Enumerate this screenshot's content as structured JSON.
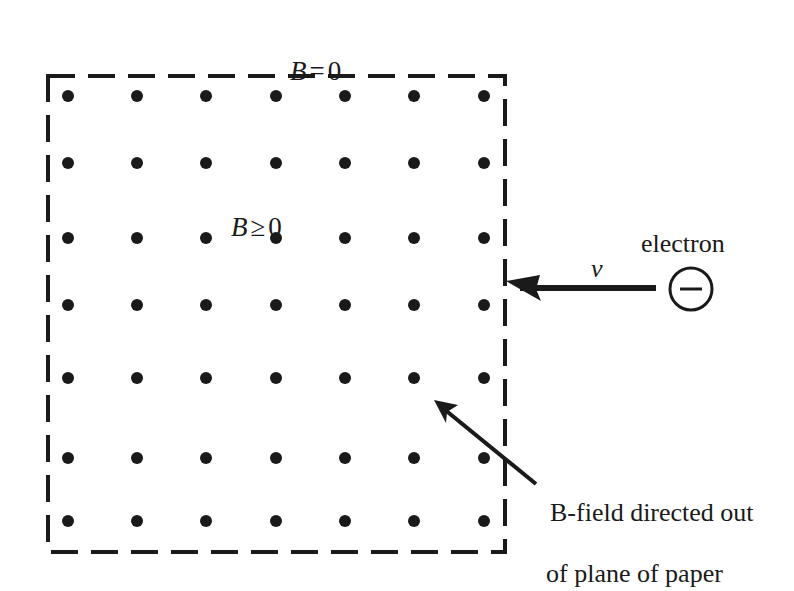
{
  "figure": {
    "background_color": "#ffffff",
    "ink_color": "#1a1a1a"
  },
  "labels": {
    "b_outside": {
      "variable": "B",
      "operator": "=",
      "value": "0"
    },
    "b_inside": {
      "variable": "B",
      "operator": "≥",
      "value": "0"
    },
    "electron": "electron",
    "velocity": "v",
    "charge_sign": "−",
    "bfield_note_line1": "B-field directed out",
    "bfield_note_line2": "of plane of paper"
  },
  "field_region": {
    "name": "dashed-field-boundary",
    "x": 48,
    "y": 76,
    "width": 457,
    "height": 476,
    "stroke_color": "#1a1a1a",
    "stroke_width": 4,
    "dash_pattern": "27 13"
  },
  "dot_grid": {
    "name": "field-dot-grid",
    "columns": 7,
    "rows": 7,
    "dot_radius": 6,
    "dot_color": "#1a1a1a",
    "x_positions": [
      68,
      137,
      206,
      276,
      345,
      414,
      484
    ],
    "y_positions": [
      96,
      163,
      238,
      305,
      378,
      458,
      521
    ]
  },
  "velocity_arrow": {
    "name": "velocity-arrow",
    "from_x": 656,
    "from_y": 288,
    "to_x": 508,
    "to_y": 288,
    "stroke_width": 6,
    "color": "#1a1a1a",
    "direction": "left"
  },
  "electron_marker": {
    "name": "electron-circle",
    "center_x": 691,
    "center_y": 289,
    "radius": 21,
    "stroke_width": 3,
    "color": "#1a1a1a"
  },
  "annotation_arrow": {
    "name": "bfield-pointer-arrow",
    "from_x": 536,
    "from_y": 484,
    "to_x": 437,
    "to_y": 403,
    "stroke_width": 4,
    "color": "#1a1a1a"
  },
  "chart_data": {
    "type": "diagram",
    "elements": [
      {
        "kind": "region",
        "label": "B ≥ 0",
        "shape": "dashed rectangle",
        "meaning": "region containing magnetic field out of the page"
      },
      {
        "kind": "region",
        "label": "B = 0",
        "shape": "outside rectangle",
        "meaning": "field-free region"
      },
      {
        "kind": "vector_field",
        "symbol": "dot",
        "count": 49,
        "meaning": "B-field directed out of plane of paper"
      },
      {
        "kind": "particle",
        "label": "electron",
        "charge": "−",
        "velocity_label": "v",
        "velocity_direction": "leftward, into the field region"
      }
    ]
  }
}
